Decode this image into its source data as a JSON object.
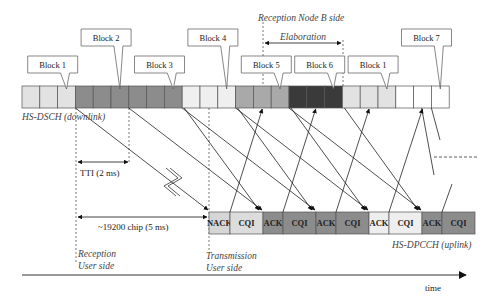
{
  "diagram": {
    "downlink": {
      "label": "HS-DSCH (downlink)",
      "blocks": [
        {
          "name": "Block 1",
          "color": "#e2e2e2"
        },
        {
          "name": "Block 2",
          "color": "#8c8c8c"
        },
        {
          "name": "Block 3",
          "color": "#8c8c8c"
        },
        {
          "name": "Block 4",
          "color": "#efefef"
        },
        {
          "name": "Block 5",
          "color": "#a9a9a9"
        },
        {
          "name": "Block 6",
          "color": "#3a3a3a"
        },
        {
          "name": "Block 1",
          "color": "#e2e2e2"
        },
        {
          "name": "Block 7",
          "color": "#ffffff"
        }
      ],
      "slots_per_block": 3
    },
    "uplink": {
      "label": "HS-DPCCH (uplink)",
      "fields": [
        {
          "text": "NACK",
          "color": "#d6d6d6"
        },
        {
          "text": "CQI",
          "color": "#dcdcdc"
        },
        {
          "text": "ACK",
          "color": "#8c8c8c"
        },
        {
          "text": "CQI",
          "color": "#8c8c8c"
        },
        {
          "text": "ACK",
          "color": "#8c8c8c"
        },
        {
          "text": "CQI",
          "color": "#8c8c8c"
        },
        {
          "text": "ACK",
          "color": "#eeeeee"
        },
        {
          "text": "CQI",
          "color": "#eeeeee"
        },
        {
          "text": "ACK",
          "color": "#8c8c8c"
        },
        {
          "text": "CQI",
          "color": "#8c8c8c"
        }
      ]
    },
    "annotations": {
      "reception_node_b": "Reception Node B side",
      "elaboration": "Elaboration",
      "tti": "TTI (2 ms)",
      "chip_offset": "~19200 chip (5 ms)",
      "reception_user_1": "Reception",
      "reception_user_2": "User side",
      "transmission_user_1": "Transmission",
      "transmission_user_2": "User side",
      "time_axis": "time"
    }
  }
}
